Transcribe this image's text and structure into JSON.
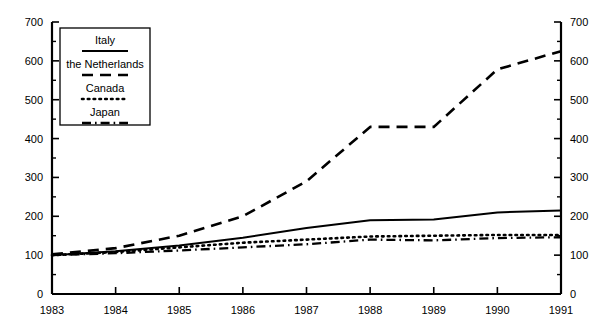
{
  "chart_data": {
    "type": "line",
    "title": "",
    "subtitle": "",
    "xlabel": "",
    "ylabel": "",
    "xlim": [
      1983,
      1991
    ],
    "ylim": [
      0,
      700
    ],
    "grid": false,
    "legend_position": "top-left",
    "y_axis_both_sides": true,
    "x": [
      1983,
      1984,
      1985,
      1986,
      1987,
      1988,
      1989,
      1990,
      1991
    ],
    "xticklabels": [
      "1983",
      "1984",
      "1985",
      "1986",
      "1987",
      "1988",
      "1989",
      "1990",
      "1991"
    ],
    "yticks": [
      0,
      100,
      200,
      300,
      400,
      500,
      600,
      700
    ],
    "yticklabels": [
      "0",
      "100",
      "200",
      "300",
      "400",
      "500",
      "600",
      "700"
    ],
    "yminorticks": [
      50,
      150,
      250,
      350,
      450,
      550,
      650
    ],
    "series": [
      {
        "name": "Italy",
        "style": "solid",
        "color": "#000000",
        "values": [
          100,
          110,
          125,
          145,
          170,
          190,
          192,
          210,
          215
        ]
      },
      {
        "name": "the Netherlands",
        "style": "dashed",
        "color": "#000000",
        "values": [
          102,
          118,
          150,
          200,
          290,
          430,
          430,
          578,
          625
        ]
      },
      {
        "name": "Canada",
        "style": "dotted",
        "color": "#000000",
        "values": [
          100,
          108,
          120,
          132,
          140,
          148,
          150,
          152,
          152
        ]
      },
      {
        "name": "Japan",
        "style": "dashdot",
        "color": "#000000",
        "values": [
          100,
          105,
          112,
          120,
          128,
          140,
          138,
          144,
          146
        ]
      }
    ]
  },
  "legend": {
    "items": [
      {
        "label": "Italy",
        "style": "solid"
      },
      {
        "label": "the Netherlands",
        "style": "dashed"
      },
      {
        "label": "Canada",
        "style": "dotted"
      },
      {
        "label": "Japan",
        "style": "dashdot"
      }
    ]
  }
}
